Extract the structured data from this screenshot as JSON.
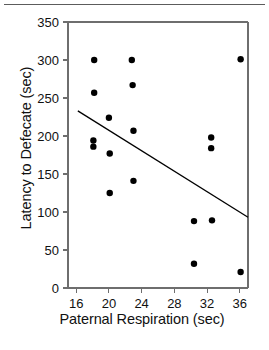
{
  "figure": {
    "has_top_rule": true,
    "background_color": "#ffffff",
    "ink_color": "#111111",
    "frame_color": "#6e6e6e"
  },
  "chart_data": {
    "type": "scatter",
    "title": "",
    "xlabel": "Paternal Respiration (sec)",
    "ylabel": "Latency to Defecate (sec)",
    "xlim": [
      15.0,
      37.0
    ],
    "ylim": [
      0,
      350
    ],
    "xticks": [
      16,
      20,
      24,
      28,
      32,
      36
    ],
    "xticklabels": [
      "16",
      "20",
      "24",
      "28",
      "32",
      "36"
    ],
    "yticks": [
      0,
      50,
      100,
      150,
      200,
      250,
      300,
      350
    ],
    "yticklabels": [
      "0",
      "50",
      "100",
      "150",
      "200",
      "250",
      "300",
      "350"
    ],
    "grid": false,
    "legend": null,
    "marker": {
      "shape": "circle",
      "color": "#000000",
      "size_px": 6.4
    },
    "points": [
      {
        "x": 18.2,
        "y": 300
      },
      {
        "x": 18.2,
        "y": 257
      },
      {
        "x": 18.1,
        "y": 194
      },
      {
        "x": 18.1,
        "y": 186
      },
      {
        "x": 20.0,
        "y": 224
      },
      {
        "x": 20.1,
        "y": 177
      },
      {
        "x": 20.1,
        "y": 125
      },
      {
        "x": 22.8,
        "y": 300
      },
      {
        "x": 22.9,
        "y": 267
      },
      {
        "x": 23.0,
        "y": 207
      },
      {
        "x": 23.0,
        "y": 141
      },
      {
        "x": 30.4,
        "y": 88
      },
      {
        "x": 30.4,
        "y": 32
      },
      {
        "x": 32.5,
        "y": 198
      },
      {
        "x": 32.5,
        "y": 184
      },
      {
        "x": 32.6,
        "y": 89
      },
      {
        "x": 36.1,
        "y": 301
      },
      {
        "x": 36.1,
        "y": 21
      }
    ],
    "trendline": {
      "type": "linear-fit",
      "color": "#000000",
      "x_start": 16.2,
      "y_start": 233,
      "x_end": 37.0,
      "y_end": 93
    }
  }
}
